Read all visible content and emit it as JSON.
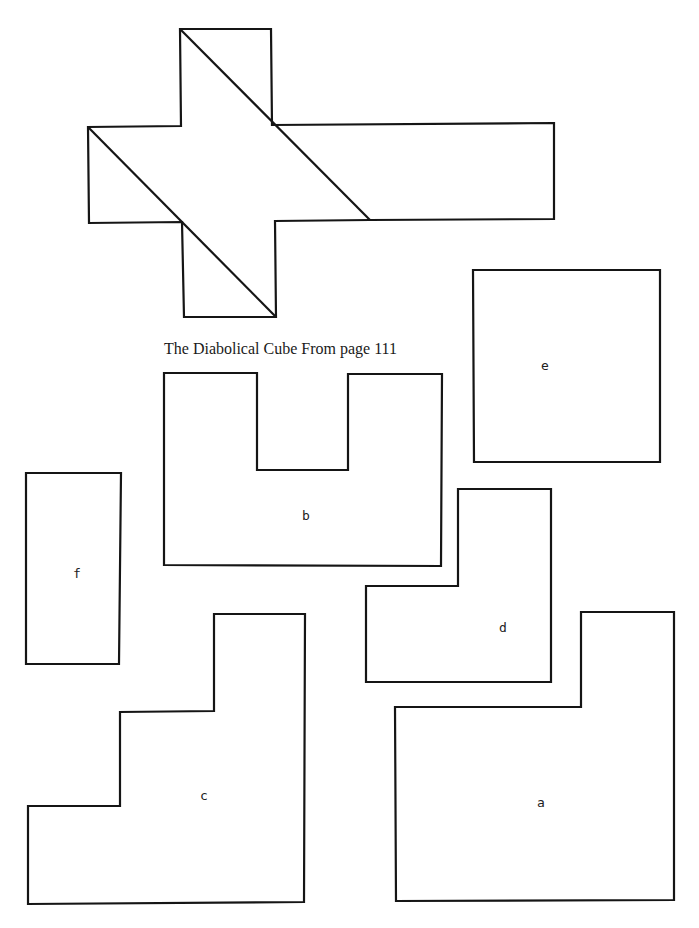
{
  "caption": "The Diabolical Cube From page 111",
  "cube_net": {
    "outline": "M180,29 L271,29 L272,125 L554,123 L554,219 L370,220 L275,221 L276,317 L184,317 L182,222 L89,223 L88,127 L181,126 Z",
    "diagonals": [
      {
        "x1": 180,
        "y1": 29,
        "x2": 370,
        "y2": 220
      },
      {
        "x1": 88,
        "y1": 127,
        "x2": 276,
        "y2": 317
      }
    ]
  },
  "pieces": [
    {
      "label": "e",
      "path": "M473,270 L660,270 L660,462 L474,462 Z",
      "label_x": 541,
      "label_y": 370
    },
    {
      "label": "b",
      "path": "M164,373 L257,373 L257,470 L348,470 L348,374 L442,374 L441,566 L164,565 Z",
      "label_x": 302,
      "label_y": 520
    },
    {
      "label": "f",
      "path": "M26,473 L121,473 L119,664 L26,664 Z",
      "label_x": 73,
      "label_y": 578
    },
    {
      "label": "d",
      "path": "M458,489 L551,489 L551,682 L366,682 L366,586 L458,586 Z",
      "label_x": 499,
      "label_y": 632
    },
    {
      "label": "c",
      "path": "M214,614 L305,614 L304,902 L28,904 L28,806 L120,806 L120,712 L214,711 Z",
      "label_x": 200,
      "label_y": 800
    },
    {
      "label": "a",
      "path": "M581,612 L674,612 L674,900 L396,901 L395,707 L581,707 Z",
      "label_x": 537,
      "label_y": 807
    }
  ]
}
